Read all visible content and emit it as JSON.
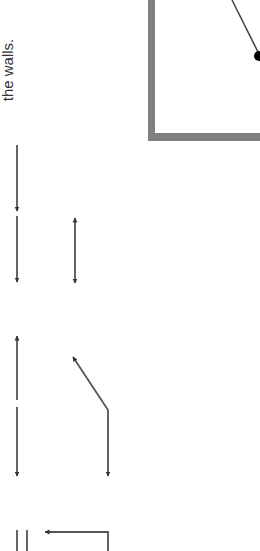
{
  "caption": {
    "text": "the walls.",
    "orientation": "rotated -90deg"
  },
  "colors": {
    "box_border": "#808080",
    "arrow": "#444444",
    "bob": "#000000",
    "text": "#333333"
  },
  "diagram": {
    "box": {
      "left": 151,
      "bottom": 137,
      "border_width": 7
    },
    "pendulum": {
      "x1": 232,
      "y1": 0,
      "x2": 258,
      "y2": 52,
      "bob_cx": 259,
      "bob_cy": 56,
      "bob_r": 5
    },
    "arrows": [
      {
        "name": "arrow-down-1",
        "x": 17,
        "y1": 145,
        "y2": 211,
        "head": "end"
      },
      {
        "name": "arrow-down-2",
        "x": 17,
        "y1": 216,
        "y2": 282,
        "head": "end"
      },
      {
        "name": "arrow-double-vertical",
        "x": 75,
        "y1": 218,
        "y2": 283,
        "head": "both"
      },
      {
        "name": "arrow-up-3",
        "x": 17,
        "y1": 400,
        "y2": 336,
        "head": "end"
      },
      {
        "name": "arrow-down-4",
        "x": 17,
        "y1": 407,
        "y2": 476,
        "head": "end"
      },
      {
        "name": "arrow-bent",
        "points": "73,357 108,410 108,476",
        "head": "both"
      },
      {
        "name": "arrow-l-left",
        "points": "108,551 108,532 45,532",
        "head": "end"
      }
    ],
    "ticks": [
      {
        "x": 17,
        "y1": 530,
        "y2": 551
      },
      {
        "x": 27,
        "y1": 530,
        "y2": 551
      }
    ]
  }
}
